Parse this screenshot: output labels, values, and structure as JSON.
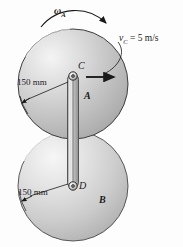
{
  "figure": {
    "background_color": "#ffffff",
    "line_color": "#1a1a1a",
    "disk_fill_light": "#f2f2f2",
    "disk_fill_mid": "#c9c9c9",
    "disk_fill_dark": "#a8a8a8",
    "bar_fill": "#bdbdbd"
  },
  "labels": {
    "omega_a": "ω",
    "omega_a_sub": "A",
    "velocity_c": "v",
    "velocity_c_sub": "C",
    "velocity_c_value": "= 5 m/s",
    "point_c": "C",
    "point_d": "D",
    "disk_a": "A",
    "disk_b": "B",
    "dim_top": "150 mm",
    "dim_bottom": "150 mm"
  },
  "geometry": {
    "disk_a_center_x": 73,
    "disk_a_center_y": 84,
    "disk_a_radius": 55,
    "disk_b_center_x": 73,
    "disk_b_center_y": 186,
    "disk_b_radius": 55,
    "pin_c_x": 73,
    "pin_c_y": 76,
    "pin_d_x": 73,
    "pin_d_y": 186,
    "bar_width": 11,
    "velocity_arrow_length": 28,
    "radius_value_mm": 150,
    "velocity_value_ms": 5
  }
}
